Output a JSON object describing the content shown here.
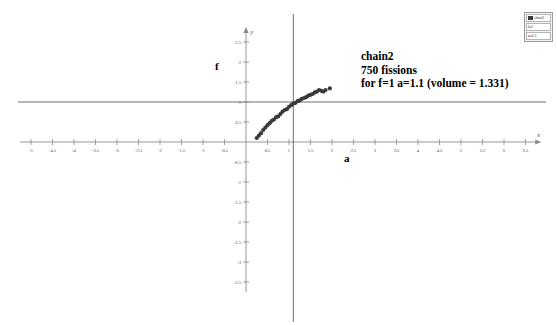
{
  "figure": {
    "annotation": {
      "line1": "chain2",
      "line2": "750 fissions",
      "line3": "for f=1 a=1.1 (volume = 1.331)"
    },
    "axis_titles": {
      "y_title": "f",
      "x_title": "a"
    },
    "axis_names": {
      "x": "x",
      "y": "y"
    },
    "legend": {
      "row1": "chain2",
      "row2": "f=1",
      "row3": "a=1.1"
    },
    "colors": {
      "axis": "#8a8a8a",
      "text": "#000000",
      "marker": "#3a3a3a",
      "guide_line": "#6f6f6f",
      "background": "#ffffff"
    }
  },
  "chart_data": {
    "type": "scatter",
    "title": "chain2",
    "subtitle": "750 fissions",
    "annotation": "for f=1 a=1.1 (volume = 1.331)",
    "xlabel": "a",
    "ylabel": "f",
    "xlim": [
      -5.25,
      6.75
    ],
    "ylim": [
      -3.75,
      2.75
    ],
    "grid": false,
    "legend_position": "top-right",
    "x_ticks": [
      -5,
      -4.5,
      -4,
      -3.5,
      -3,
      -2.5,
      -2,
      -1.5,
      -1,
      -0.5,
      0.5,
      1,
      1.5,
      2,
      2.5,
      3,
      3.5,
      4,
      4.5,
      5,
      5.5,
      6,
      6.5
    ],
    "x_tick_labels": [
      "-5",
      "-4.5",
      "-4",
      "-3.5",
      "-3",
      "-2.5",
      "-2",
      "-1.5",
      "-1",
      "-0.5",
      "0.5",
      "1",
      "1.5",
      "2",
      "2.5",
      "3",
      "3.5",
      "4",
      "4.5",
      "5",
      "5.5",
      "6",
      "6.5"
    ],
    "y_ticks": [
      2.5,
      2,
      1.5,
      1,
      0.5,
      -0.5,
      -1,
      -1.5,
      -2,
      -2.5,
      -3,
      -3.5
    ],
    "y_tick_labels": [
      "2.5",
      "2",
      "1.5",
      "1",
      "0.5",
      "-0.5",
      "-1",
      "-1.5",
      "-2",
      "-2.5",
      "-3",
      "-3.5"
    ],
    "reference_lines": [
      {
        "name": "f=1",
        "orientation": "horizontal",
        "value": 1
      },
      {
        "name": "a=1.1",
        "orientation": "vertical",
        "value": 1.1
      }
    ],
    "series": [
      {
        "name": "chain2",
        "marker": "filled-circle",
        "points": [
          [
            0.25,
            0.1
          ],
          [
            0.3,
            0.16
          ],
          [
            0.35,
            0.22
          ],
          [
            0.4,
            0.3
          ],
          [
            0.45,
            0.36
          ],
          [
            0.5,
            0.42
          ],
          [
            0.55,
            0.47
          ],
          [
            0.6,
            0.53
          ],
          [
            0.65,
            0.56
          ],
          [
            0.7,
            0.62
          ],
          [
            0.75,
            0.64
          ],
          [
            0.8,
            0.7
          ],
          [
            0.85,
            0.76
          ],
          [
            0.9,
            0.8
          ],
          [
            0.95,
            0.82
          ],
          [
            1.0,
            0.88
          ],
          [
            1.05,
            0.92
          ],
          [
            1.1,
            0.96
          ],
          [
            1.15,
            0.98
          ],
          [
            1.2,
            1.02
          ],
          [
            1.25,
            1.04
          ],
          [
            1.3,
            1.08
          ],
          [
            1.35,
            1.1
          ],
          [
            1.4,
            1.12
          ],
          [
            1.45,
            1.16
          ],
          [
            1.5,
            1.18
          ],
          [
            1.55,
            1.2
          ],
          [
            1.6,
            1.24
          ],
          [
            1.65,
            1.26
          ],
          [
            1.7,
            1.3
          ],
          [
            1.75,
            1.28
          ],
          [
            1.8,
            1.26
          ],
          [
            1.85,
            1.3
          ],
          [
            1.95,
            1.34
          ]
        ]
      }
    ]
  }
}
